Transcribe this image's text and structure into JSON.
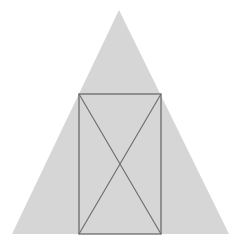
{
  "diagram": {
    "colors": {
      "background": "#ffffff",
      "triangle_fill": "#d6d6d6",
      "line": "#6a6a6a"
    },
    "triangle": {
      "apex": [
        119,
        10
      ],
      "bottom_left": [
        12,
        234
      ],
      "bottom_right": [
        229,
        234
      ]
    },
    "rectangle": {
      "x": 79,
      "y": 94,
      "width": 82,
      "height": 140
    },
    "diagonals": [
      {
        "from": [
          79,
          94
        ],
        "to": [
          161,
          234
        ]
      },
      {
        "from": [
          161,
          94
        ],
        "to": [
          79,
          234
        ]
      }
    ]
  }
}
